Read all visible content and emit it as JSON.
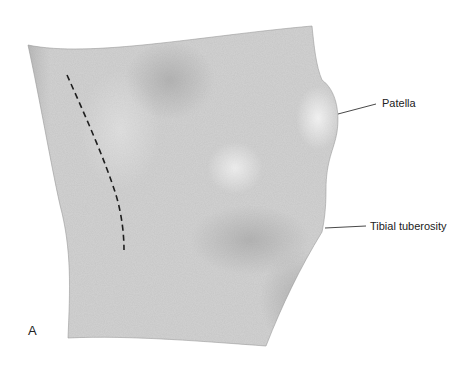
{
  "figure": {
    "panel_letter": "A",
    "labels": [
      {
        "id": "patella",
        "text": "Patella"
      },
      {
        "id": "tibial_tuberosity",
        "text": "Tibial tuberosity"
      }
    ],
    "incision_line": "dashed",
    "colors": {
      "skin_shading": "#bdbdbd",
      "shadow": "#8a8a8a",
      "line": "#333333",
      "background": "#ffffff"
    }
  }
}
